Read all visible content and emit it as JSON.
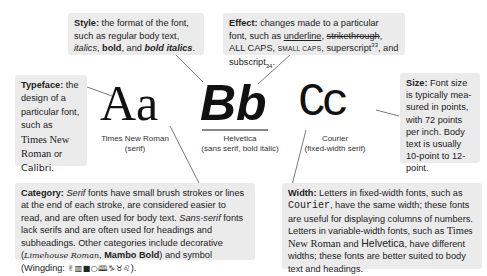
{
  "style_box": {
    "label": "Style:",
    "text_1": " the format of the font, such as regular body text, ",
    "italics": "italics",
    "sep_1": ", ",
    "bold": "bold",
    "sep_2": ", and ",
    "bold_italics": "bold italics",
    "end": "."
  },
  "effect_box": {
    "label": "Effect:",
    "text_1": " changes made to a particular font, such as ",
    "underline": "underline",
    "sep_1": ", ",
    "strikethrough": "strikethrough",
    "sep_2": ", ALL CAPS, ",
    "small_caps": "SMALL CAPS",
    "sep_3": ", superscript",
    "sup": "33",
    "sep_4": ", and subscript",
    "sub": "34",
    "end": "."
  },
  "typeface_box": {
    "label": "Typeface:",
    "text_1": " the design of a particular font, such as ",
    "times": "Times New Roman",
    "or": " or ",
    "calibri": "Calibri",
    "end": "."
  },
  "size_box": {
    "label": "Size:",
    "text": " Font size is typically mea- sured in points, with 72 points per inch. Body text is usually 10-point to 12-point."
  },
  "samples": [
    {
      "glyphs": "Aa",
      "caption_1": "Times New Roman",
      "caption_2": "(serif)"
    },
    {
      "glyphs": "Bb",
      "caption_1": "Helvetica",
      "caption_2": "(sans serif, bold italic)"
    },
    {
      "glyphs": "Cc",
      "caption_1": "Courier",
      "caption_2": "(fixed-width serif)"
    }
  ],
  "category_box": {
    "label": "Category:",
    "serif": "Serif",
    "text_1": " fonts have small brush strokes or lines at the end of each stroke, are considered easier to read, and are often used for body text. ",
    "sans_serif": "Sans-serif",
    "text_2": " fonts lack serifs and are often used for headings and subheadings. Other categories include decorative (",
    "deco_1": "Limehouse Roman",
    "sep": ", ",
    "deco_2": "Mambo Bold",
    "text_3": ") and symbol (Wingding: ",
    "wingding_glyphs": "✌▥■○🕮♑︎♉︎♌︎",
    "end": ")."
  },
  "width_box": {
    "label": "Width:",
    "text_1": " Letters in fixed-width fonts, such as ",
    "courier": "Courier",
    "text_2": ", have the same width; these fonts are useful for displaying columns of numbers. Letters in variable-width fonts, such as ",
    "times": "Times New Roman",
    "and": " and ",
    "helvetica": "Helvetica",
    "text_3": ", have different widths; these fonts are better suited to body text and headings."
  },
  "colors": {
    "box_bg": "#ebebeb",
    "line": "#555555",
    "text": "#1a1a1a"
  }
}
